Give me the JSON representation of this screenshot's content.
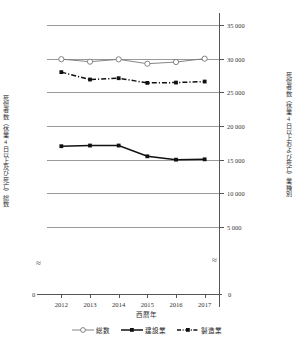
{
  "chart_data": {
    "type": "line",
    "title": "",
    "xlabel": "西暦年",
    "categories": [
      "2012",
      "2013",
      "2014",
      "2015",
      "2016",
      "2017"
    ],
    "grid": true,
    "legend_position": "bottom",
    "axes": {
      "left": {
        "label": "死傷者数（休業4日以上及び死亡）総数",
        "ticks": [
          "0",
          "20 000",
          "40 000",
          "60 000",
          "80 000",
          "100 000",
          "120 000",
          "140 000"
        ],
        "tick_values": [
          0,
          20000,
          40000,
          60000,
          80000,
          100000,
          120000,
          140000
        ],
        "ylim": [
          20000,
          140000
        ],
        "axis_break": true,
        "break_symbol": "≈",
        "zero_label": "0"
      },
      "right": {
        "label": "死傷者数（休業4日以上および死亡）業種別",
        "ticks": [
          "0",
          "5 000",
          "10 000",
          "15 000",
          "20 000",
          "25 000",
          "30 000",
          "35 000"
        ],
        "tick_values": [
          0,
          5000,
          10000,
          15000,
          20000,
          25000,
          30000,
          35000
        ],
        "ylim": [
          5000,
          35000
        ],
        "axis_break": true,
        "break_symbol": "≈",
        "zero_label": "0"
      }
    },
    "series": [
      {
        "name": "総数",
        "axis": "left",
        "marker": "open-circle",
        "linestyle": "solid",
        "color": "#777777",
        "values": [
          119700,
          118200,
          119600,
          117000,
          118000,
          120000
        ]
      },
      {
        "name": "建設業",
        "axis": "right",
        "marker": "filled-square",
        "linestyle": "solid",
        "color": "#111111",
        "values": [
          17000,
          17100,
          17100,
          15500,
          15000,
          15050
        ]
      },
      {
        "name": "製造業",
        "axis": "right",
        "marker": "filled-square",
        "linestyle": "dash-dot",
        "color": "#111111",
        "values": [
          28000,
          26900,
          27100,
          26400,
          26450,
          26600
        ]
      }
    ]
  }
}
